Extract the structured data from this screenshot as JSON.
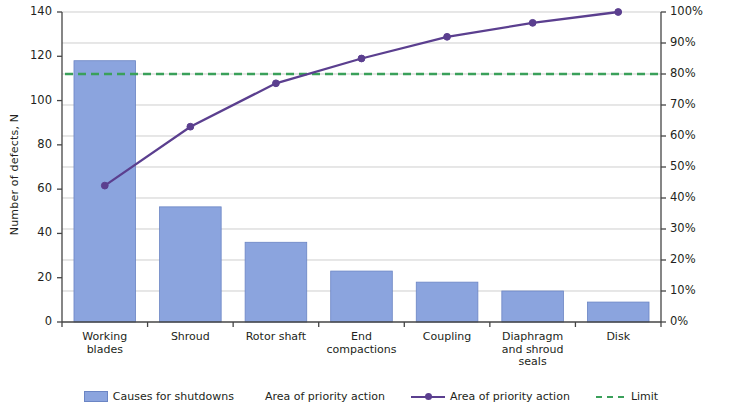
{
  "chart_data": {
    "type": "bar",
    "title": "",
    "subtitle": "",
    "categories": [
      "Working\nblades",
      "Shroud",
      "Rotor shaft",
      "End\ncompactions",
      "Coupling",
      "Diaphragm\nand shroud\nseals",
      "Disk"
    ],
    "series": [
      {
        "name": "Causes for shutdowns",
        "type": "bar",
        "axis": "left",
        "values": [
          118,
          52,
          36,
          23,
          18,
          14,
          9
        ],
        "color": "#8ba4de"
      },
      {
        "name": "Area of priority action",
        "type": "line",
        "axis": "right",
        "values": [
          44,
          63,
          77,
          85,
          92,
          96.5,
          100
        ],
        "color": "#5b3f8f",
        "marker": "circle"
      },
      {
        "name": "Limit",
        "type": "line",
        "axis": "right",
        "values": [
          80,
          80,
          80,
          80,
          80,
          80,
          80
        ],
        "color": "#3aa05a",
        "dash": "dashed"
      }
    ],
    "xlabel": "",
    "ylabel": "Number of defects, N",
    "y2label": "Percentage of defects for each feature, %",
    "ylim": [
      0,
      140
    ],
    "y2lim": [
      0,
      100
    ],
    "yticks": [
      "0",
      "20",
      "40",
      "60",
      "80",
      "100",
      "120",
      "140"
    ],
    "y2ticks": [
      "0%",
      "10%",
      "20%",
      "30%",
      "40%",
      "50%",
      "60%",
      "70%",
      "80%",
      "90%",
      "100%"
    ],
    "grid": true,
    "legend_position": "bottom",
    "legend": [
      {
        "label": "Causes for shutdowns",
        "symbol": "bar-swatch",
        "color": "#8ba4de"
      },
      {
        "label": "Area of priority action",
        "symbol": "none",
        "color": "#5b3f8f"
      },
      {
        "label": "Area of priority action",
        "symbol": "line-marker",
        "color": "#5b3f8f"
      },
      {
        "label": "Limit",
        "symbol": "dashed-line",
        "color": "#3aa05a"
      }
    ]
  },
  "axes": {
    "left_title": "Number of defects, N",
    "right_title": "Percentage of defects for each feature, %"
  },
  "y_ticks": [
    {
      "label": "140"
    },
    {
      "label": "120"
    },
    {
      "label": "100"
    },
    {
      "label": "80"
    },
    {
      "label": "60"
    },
    {
      "label": "40"
    },
    {
      "label": "20"
    },
    {
      "label": "0"
    }
  ],
  "y2_ticks": [
    {
      "label": "100%"
    },
    {
      "label": "90%"
    },
    {
      "label": "80%"
    },
    {
      "label": "70%"
    },
    {
      "label": "60%"
    },
    {
      "label": "50%"
    },
    {
      "label": "40%"
    },
    {
      "label": "30%"
    },
    {
      "label": "20%"
    },
    {
      "label": "10%"
    },
    {
      "label": "0%"
    }
  ],
  "categories": [
    {
      "label": "Working\nblades"
    },
    {
      "label": "Shroud"
    },
    {
      "label": "Rotor shaft"
    },
    {
      "label": "End\ncompactions"
    },
    {
      "label": "Coupling"
    },
    {
      "label": "Diaphragm\nand shroud\nseals"
    },
    {
      "label": "Disk"
    }
  ],
  "legend": [
    {
      "label": "Causes for shutdowns"
    },
    {
      "label": "Area of priority action"
    },
    {
      "label": "Area of priority action"
    },
    {
      "label": "Limit"
    }
  ]
}
